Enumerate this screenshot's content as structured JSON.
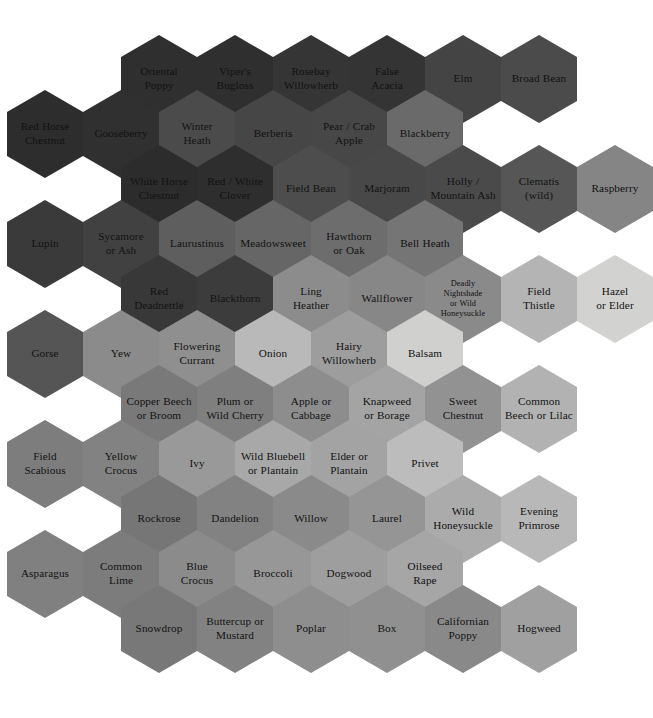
{
  "diagram": {
    "type": "hexagon-grid",
    "title": "",
    "shape": "pointy-top-hexagon",
    "hex_width": 76,
    "hex_height": 88,
    "column_pitch": 76,
    "row_pitch": 55,
    "background_color": "#ffffff",
    "text_color": "#121212",
    "gap_color": "#ffffff",
    "rows": 12,
    "total_cells": 84
  },
  "cells": [
    {
      "label": "Oriental\nPoppy",
      "color": "#2f2f2f",
      "row": 0,
      "col": 1,
      "size": "normal"
    },
    {
      "label": "Viper's\nBugloss",
      "color": "#2f2f2f",
      "row": 0,
      "col": 2,
      "size": "normal"
    },
    {
      "label": "Rosebay\nWillowherb",
      "color": "#353535",
      "row": 0,
      "col": 3,
      "size": "normal"
    },
    {
      "label": "False\nAcacia",
      "color": "#343434",
      "row": 0,
      "col": 4,
      "size": "normal"
    },
    {
      "label": "Elm",
      "color": "#444444",
      "row": 0,
      "col": 5,
      "size": "normal"
    },
    {
      "label": "Broad Bean",
      "color": "#4b4b4b",
      "row": 0,
      "col": 6,
      "size": "normal"
    },
    {
      "label": "Red Horse\nChestnut",
      "color": "#2d2d2d",
      "row": 1,
      "col": 0,
      "size": "normal"
    },
    {
      "label": "Gooseberry",
      "color": "#303030",
      "row": 1,
      "col": 1,
      "size": "normal"
    },
    {
      "label": "Winter\nHeath",
      "color": "#4b4b4b",
      "row": 1,
      "col": 2,
      "size": "normal"
    },
    {
      "label": "Berberis",
      "color": "#464646",
      "row": 1,
      "col": 3,
      "size": "normal"
    },
    {
      "label": "Pear / Crab\nApple",
      "color": "#474747",
      "row": 1,
      "col": 4,
      "size": "normal"
    },
    {
      "label": "Blackberry",
      "color": "#6a6a6a",
      "row": 1,
      "col": 5,
      "size": "normal"
    },
    {
      "label": "White Horse\nChestnut",
      "color": "#2c2c2c",
      "row": 2,
      "col": 1,
      "size": "normal"
    },
    {
      "label": "Red / White\nClover",
      "color": "#2e2e2e",
      "row": 2,
      "col": 2,
      "size": "normal"
    },
    {
      "label": "Field Bean",
      "color": "#4d4d4d",
      "row": 2,
      "col": 3,
      "size": "normal"
    },
    {
      "label": "Marjoram",
      "color": "#484848",
      "row": 2,
      "col": 4,
      "size": "normal"
    },
    {
      "label": "Holly /\nMountain Ash",
      "color": "#4a4a4a",
      "row": 2,
      "col": 5,
      "size": "normal"
    },
    {
      "label": "Clematis\n(wild)",
      "color": "#565656",
      "row": 2,
      "col": 6,
      "size": "normal"
    },
    {
      "label": "Raspberry",
      "color": "#858585",
      "row": 2,
      "col": 7,
      "size": "normal"
    },
    {
      "label": "Lupin",
      "color": "#3a3a3a",
      "row": 3,
      "col": 0,
      "size": "normal"
    },
    {
      "label": "Sycamore\nor Ash",
      "color": "#414141",
      "row": 3,
      "col": 1,
      "size": "normal"
    },
    {
      "label": "Laurustinus",
      "color": "#5e5e5e",
      "row": 3,
      "col": 2,
      "size": "normal"
    },
    {
      "label": "Meadowsweet",
      "color": "#666666",
      "row": 3,
      "col": 3,
      "size": "normal"
    },
    {
      "label": "Hawthorn\nor Oak",
      "color": "#6d6d6d",
      "row": 3,
      "col": 4,
      "size": "normal"
    },
    {
      "label": "Bell Heath",
      "color": "#757575",
      "row": 3,
      "col": 5,
      "size": "normal"
    },
    {
      "label": "Red\nDeadnettle",
      "color": "#383838",
      "row": 4,
      "col": 1,
      "size": "normal"
    },
    {
      "label": "Blackthorn",
      "color": "#3c3c3c",
      "row": 4,
      "col": 2,
      "size": "normal"
    },
    {
      "label": "Ling\nHeather",
      "color": "#8c8c8c",
      "row": 4,
      "col": 3,
      "size": "normal"
    },
    {
      "label": "Wallflower",
      "color": "#878787",
      "row": 4,
      "col": 4,
      "size": "normal"
    },
    {
      "label": "Deadly\nNightshade\nor Wild\nHoneysuckle",
      "color": "#8a8a8a",
      "row": 4,
      "col": 5,
      "size": "sm"
    },
    {
      "label": "Field\nThistle",
      "color": "#b4b4b4",
      "row": 4,
      "col": 6,
      "size": "normal"
    },
    {
      "label": "Hazel\nor Elder",
      "color": "#d2d2d0",
      "row": 4,
      "col": 7,
      "size": "normal"
    },
    {
      "label": "Gorse",
      "color": "#555555",
      "row": 5,
      "col": 0,
      "size": "normal"
    },
    {
      "label": "Yew",
      "color": "#8b8b8b",
      "row": 5,
      "col": 1,
      "size": "normal"
    },
    {
      "label": "Flowering\nCurrant",
      "color": "#8f8f8f",
      "row": 5,
      "col": 2,
      "size": "normal"
    },
    {
      "label": "Onion",
      "color": "#b9b9b9",
      "row": 5,
      "col": 3,
      "size": "normal"
    },
    {
      "label": "Hairy\nWillowherb",
      "color": "#9d9d9d",
      "row": 5,
      "col": 4,
      "size": "normal"
    },
    {
      "label": "Balsam",
      "color": "#d0d0ce",
      "row": 5,
      "col": 5,
      "size": "normal"
    },
    {
      "label": "Copper Beech\nor Broom",
      "color": "#797979",
      "row": 6,
      "col": 1,
      "size": "normal"
    },
    {
      "label": "Plum or\nWild Cherry",
      "color": "#7f7f7f",
      "row": 6,
      "col": 2,
      "size": "normal"
    },
    {
      "label": "Apple or\nCabbage",
      "color": "#8d8d8d",
      "row": 6,
      "col": 3,
      "size": "normal"
    },
    {
      "label": "Knapweed\nor Borage",
      "color": "#a4a4a4",
      "row": 6,
      "col": 4,
      "size": "normal"
    },
    {
      "label": "Sweet\nChestnut",
      "color": "#929292",
      "row": 6,
      "col": 5,
      "size": "normal"
    },
    {
      "label": "Common\nBeech or Lilac",
      "color": "#b2b2b2",
      "row": 6,
      "col": 6,
      "size": "normal"
    },
    {
      "label": "Field\nScabious",
      "color": "#7d7d7d",
      "row": 7,
      "col": 0,
      "size": "normal"
    },
    {
      "label": "Yellow\nCrocus",
      "color": "#828282",
      "row": 7,
      "col": 1,
      "size": "normal"
    },
    {
      "label": "Ivy",
      "color": "#999999",
      "row": 7,
      "col": 2,
      "size": "normal"
    },
    {
      "label": "Wild Bluebell\nor Plantain",
      "color": "#a8a8a8",
      "row": 7,
      "col": 3,
      "size": "normal"
    },
    {
      "label": "Elder or\nPlantain",
      "color": "#a3a3a3",
      "row": 7,
      "col": 4,
      "size": "normal"
    },
    {
      "label": "Privet",
      "color": "#bcbcbc",
      "row": 7,
      "col": 5,
      "size": "normal"
    },
    {
      "label": "Rockrose",
      "color": "#767676",
      "row": 8,
      "col": 1,
      "size": "normal"
    },
    {
      "label": "Dandelion",
      "color": "#828282",
      "row": 8,
      "col": 2,
      "size": "normal"
    },
    {
      "label": "Willow",
      "color": "#8a8a8a",
      "row": 8,
      "col": 3,
      "size": "normal"
    },
    {
      "label": "Laurel",
      "color": "#959595",
      "row": 8,
      "col": 4,
      "size": "normal"
    },
    {
      "label": "Wild\nHoneysuckle",
      "color": "#ababab",
      "row": 8,
      "col": 5,
      "size": "normal"
    },
    {
      "label": "Evening\nPrimrose",
      "color": "#b8b8b8",
      "row": 8,
      "col": 6,
      "size": "normal"
    },
    {
      "label": "Asparagus",
      "color": "#808080",
      "row": 9,
      "col": 0,
      "size": "normal"
    },
    {
      "label": "Common\nLime",
      "color": "#7c7c7c",
      "row": 9,
      "col": 1,
      "size": "normal"
    },
    {
      "label": "Blue\nCrocus",
      "color": "#8b8b8b",
      "row": 9,
      "col": 2,
      "size": "normal"
    },
    {
      "label": "Broccoli",
      "color": "#979797",
      "row": 9,
      "col": 3,
      "size": "normal"
    },
    {
      "label": "Dogwood",
      "color": "#9e9e9e",
      "row": 9,
      "col": 4,
      "size": "normal"
    },
    {
      "label": "Oilseed\nRape",
      "color": "#a6a6a6",
      "row": 9,
      "col": 5,
      "size": "normal"
    },
    {
      "label": "Snowdrop",
      "color": "#787878",
      "row": 10,
      "col": 1,
      "size": "normal"
    },
    {
      "label": "Buttercup or\nMustard",
      "color": "#828282",
      "row": 10,
      "col": 2,
      "size": "normal"
    },
    {
      "label": "Poplar",
      "color": "#8e8e8e",
      "row": 10,
      "col": 3,
      "size": "normal"
    },
    {
      "label": "Box",
      "color": "#909090",
      "row": 10,
      "col": 4,
      "size": "normal"
    },
    {
      "label": "Californian\nPoppy",
      "color": "#898989",
      "row": 10,
      "col": 5,
      "size": "normal"
    },
    {
      "label": "Hogweed",
      "color": "#a0a0a0",
      "row": 10,
      "col": 6,
      "size": "normal"
    }
  ]
}
